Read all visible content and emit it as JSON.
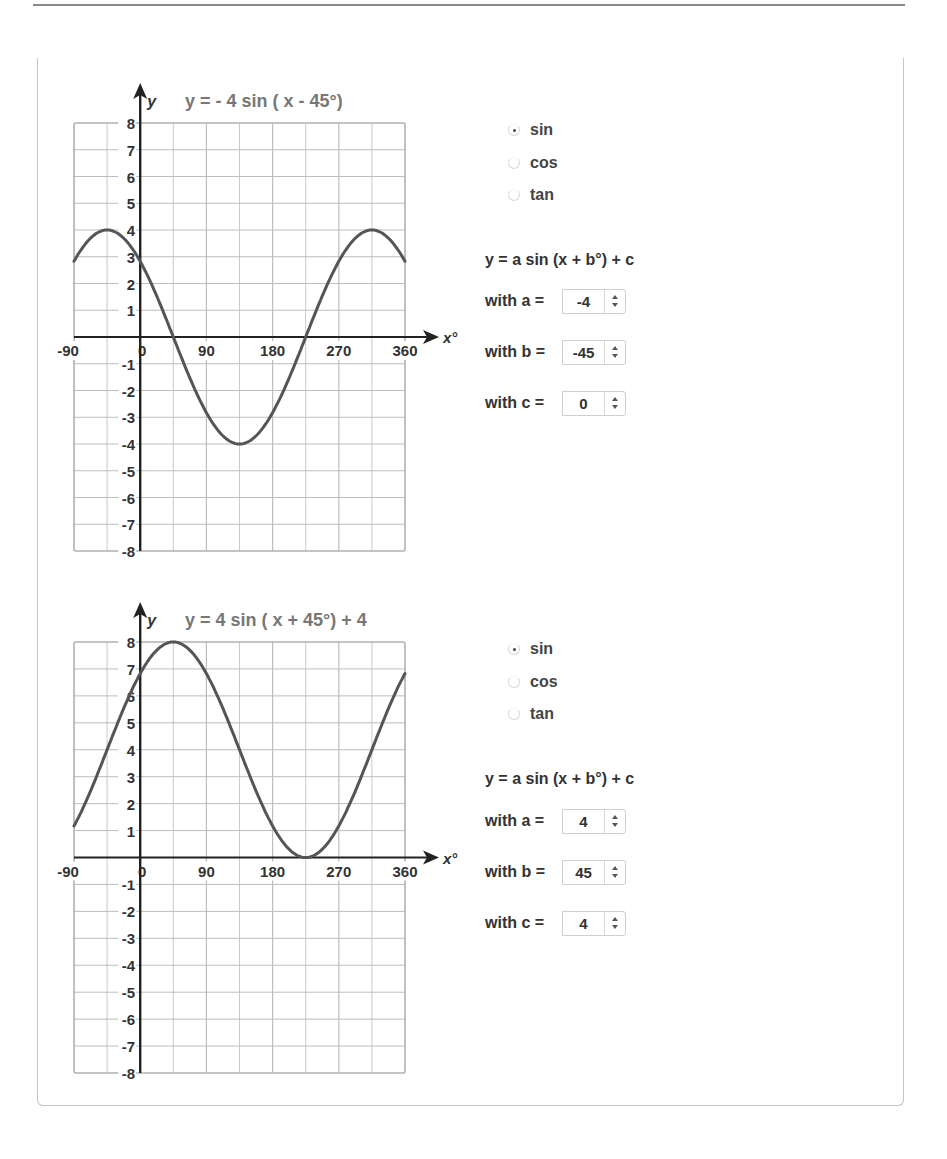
{
  "panels": [
    {
      "equation": "y =  - 4 sin ( x - 45°)",
      "functions": [
        {
          "label": "sin",
          "checked": true
        },
        {
          "label": "cos",
          "checked": false
        },
        {
          "label": "tan",
          "checked": false
        }
      ],
      "formula": "y = a sin (x + b°) + c",
      "params": [
        {
          "label": "with a =",
          "value": "-4"
        },
        {
          "label": "with b =",
          "value": "-45"
        },
        {
          "label": "with c =",
          "value": "0"
        }
      ]
    },
    {
      "equation": "y =  4 sin ( x + 45°)  + 4",
      "functions": [
        {
          "label": "sin",
          "checked": true
        },
        {
          "label": "cos",
          "checked": false
        },
        {
          "label": "tan",
          "checked": false
        }
      ],
      "formula": "y = a sin (x + b°) + c",
      "params": [
        {
          "label": "with a =",
          "value": "4"
        },
        {
          "label": "with b =",
          "value": "45"
        },
        {
          "label": "with c =",
          "value": "4"
        }
      ]
    }
  ],
  "axes": {
    "x_label": "x°",
    "y_label": "y",
    "x_ticks": [
      "-90",
      "0",
      "90",
      "180",
      "270",
      "360"
    ],
    "y_ticks": [
      "8",
      "7",
      "6",
      "5",
      "4",
      "3",
      "2",
      "1",
      "-1",
      "-2",
      "-3",
      "-4",
      "-5",
      "-6",
      "-7",
      "-8"
    ]
  },
  "colors": {
    "curve": "#555555",
    "grid": "#bdbdbd",
    "axis": "#222222",
    "equation_text": "#777777"
  },
  "chart_data": [
    {
      "type": "line",
      "title": "y =  - 4 sin ( x - 45°)",
      "xlabel": "x°",
      "ylabel": "y",
      "xlim": [
        -90,
        360
      ],
      "ylim": [
        -8,
        8
      ],
      "grid": true,
      "x_tick_step_grid": 45,
      "x": [
        -90,
        -45,
        0,
        45,
        90,
        135,
        180,
        225,
        270,
        315,
        360
      ],
      "series": [
        {
          "name": "y = -4 sin(x - 45°)",
          "values": [
            2.83,
            4,
            2.83,
            0,
            -2.83,
            -4,
            -2.83,
            0,
            2.83,
            4,
            2.83
          ]
        }
      ]
    },
    {
      "type": "line",
      "title": "y =  4 sin ( x + 45°)  + 4",
      "xlabel": "x°",
      "ylabel": "y",
      "xlim": [
        -90,
        360
      ],
      "ylim": [
        -8,
        8
      ],
      "grid": true,
      "x_tick_step_grid": 45,
      "x": [
        -90,
        -45,
        0,
        45,
        90,
        135,
        180,
        225,
        270,
        315,
        360
      ],
      "series": [
        {
          "name": "y = 4 sin(x + 45°) + 4",
          "values": [
            1.17,
            4,
            6.83,
            8,
            6.83,
            4,
            1.17,
            0,
            1.17,
            4,
            6.83
          ]
        }
      ]
    }
  ]
}
